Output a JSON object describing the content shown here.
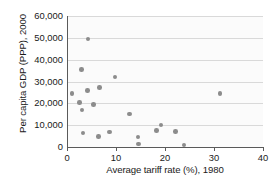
{
  "chart_data": {
    "type": "scatter",
    "title": "",
    "xlabel": "Average tariff rate (%), 1980",
    "ylabel": "Per capita GDP (PPP), 2000",
    "xlim": [
      0,
      40
    ],
    "ylim": [
      0,
      60000
    ],
    "xticks": [
      0,
      10,
      20,
      30,
      40
    ],
    "xtick_labels": [
      "0",
      "10",
      "20",
      "30",
      "40"
    ],
    "yticks": [
      0,
      10000,
      20000,
      30000,
      40000,
      50000,
      60000
    ],
    "ytick_labels": [
      "0",
      "10,000",
      "20,000",
      "30,000",
      "40,000",
      "50,000",
      "60,000"
    ],
    "grid": true,
    "grid_axis": "y",
    "legend": false,
    "point_color": "#8c8c8c",
    "points": [
      {
        "x": 1.0,
        "y": 24500
      },
      {
        "x": 2.9,
        "y": 35500
      },
      {
        "x": 2.6,
        "y": 20300
      },
      {
        "x": 3.1,
        "y": 17000
      },
      {
        "x": 3.3,
        "y": 6400
      },
      {
        "x": 4.3,
        "y": 49400
      },
      {
        "x": 4.2,
        "y": 26000
      },
      {
        "x": 5.4,
        "y": 19400
      },
      {
        "x": 6.4,
        "y": 4700
      },
      {
        "x": 6.6,
        "y": 27300
      },
      {
        "x": 8.7,
        "y": 6900
      },
      {
        "x": 9.8,
        "y": 32000
      },
      {
        "x": 12.8,
        "y": 15100
      },
      {
        "x": 14.5,
        "y": 4600
      },
      {
        "x": 14.6,
        "y": 1400
      },
      {
        "x": 18.3,
        "y": 7600
      },
      {
        "x": 19.2,
        "y": 10100
      },
      {
        "x": 22.2,
        "y": 7000
      },
      {
        "x": 23.9,
        "y": 900
      },
      {
        "x": 31.2,
        "y": 24500
      }
    ]
  }
}
